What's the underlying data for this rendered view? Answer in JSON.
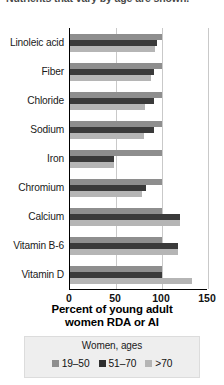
{
  "caption": {
    "text": "Nutrients that vary by age are shown."
  },
  "chart_data": {
    "type": "bar",
    "orientation": "horizontal",
    "title": "",
    "xlabel_lines": [
      "Percent of young adult",
      "women RDA or AI"
    ],
    "ylabel": "",
    "xlim": [
      0,
      150
    ],
    "xticks": [
      0,
      50,
      100,
      150
    ],
    "xtick_labels": [
      "0",
      "50",
      "100",
      "150"
    ],
    "grid": true,
    "grid_axis": "x",
    "legend_title": "Women, ages",
    "legend_position": "bottom",
    "categories": [
      "Linoleic acid",
      "Fiber",
      "Chloride",
      "Sodium",
      "Iron",
      "Chromium",
      "Calcium",
      "Vitamin B-6",
      "Vitamin D"
    ],
    "series": [
      {
        "name": "19–50",
        "color": "#8e8e8e",
        "values": [
          100,
          100,
          100,
          100,
          100,
          100,
          100,
          100,
          100
        ]
      },
      {
        "name": "51–70",
        "color": "#2e2e2e",
        "values": [
          95,
          91,
          91,
          91,
          48,
          83,
          120,
          117,
          100
        ]
      },
      {
        "name": ">70",
        "color": "#b5b5b5",
        "values": [
          92,
          88,
          82,
          80,
          48,
          78,
          120,
          117,
          133
        ]
      }
    ]
  }
}
